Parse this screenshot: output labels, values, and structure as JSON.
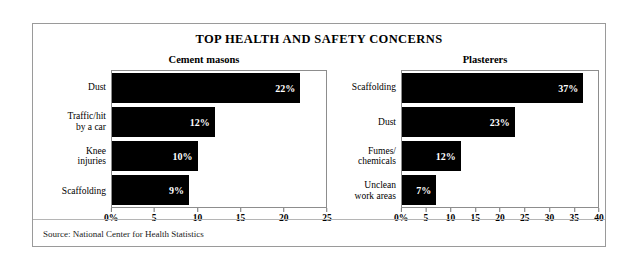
{
  "card": {
    "title": "TOP HEALTH AND SAFETY CONCERNS",
    "source": "Source: National Center for Health Statistics"
  },
  "chart_data": [
    {
      "type": "bar",
      "orientation": "horizontal",
      "title": "Cement masons",
      "xlabel": "",
      "ylabel": "",
      "xlim": [
        0,
        25
      ],
      "grid": false,
      "legend": null,
      "categories": [
        "Dust",
        "Traffic/hit\nby a car",
        "Knee\ninjuries",
        "Scaffolding"
      ],
      "values": [
        22,
        12,
        10,
        9
      ],
      "value_labels": [
        "22%",
        "12%",
        "10%",
        "9%"
      ],
      "tick_values": [
        0,
        5,
        10,
        15,
        20,
        25
      ],
      "tick_labels": [
        "0%",
        "5",
        "10",
        "15",
        "20",
        "25"
      ],
      "bar_color": "#000000",
      "label_color": "#ffffff"
    },
    {
      "type": "bar",
      "orientation": "horizontal",
      "title": "Plasterers",
      "xlabel": "",
      "ylabel": "",
      "xlim": [
        0,
        40
      ],
      "grid": false,
      "legend": null,
      "categories": [
        "Scaffolding",
        "Dust",
        "Fumes/\nchemicals",
        "Unclean\nwork areas"
      ],
      "values": [
        37,
        23,
        12,
        7
      ],
      "value_labels": [
        "37%",
        "23%",
        "12%",
        "7%"
      ],
      "tick_values": [
        0,
        5,
        10,
        15,
        20,
        25,
        30,
        35,
        40
      ],
      "tick_labels": [
        "0%",
        "5",
        "10",
        "15",
        "20",
        "25",
        "30",
        "35",
        "40"
      ],
      "bar_color": "#000000",
      "label_color": "#ffffff"
    }
  ]
}
